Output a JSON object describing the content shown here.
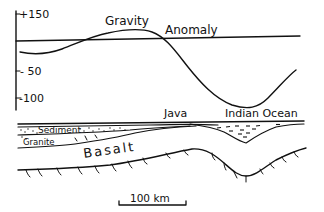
{
  "figure": {
    "type": "geological cross-section with gravity anomaly profile",
    "gravity_panel": {
      "axis_ticks": [
        {
          "label": "+150",
          "value": 150
        },
        {
          "label": "- 50",
          "value": -50
        },
        {
          "label": "-100",
          "value": -100
        }
      ],
      "title_part1": "Gravity",
      "title_part2": "Anomaly"
    },
    "section": {
      "place_labels": {
        "java": "Java",
        "indian_ocean": "Indian Ocean"
      },
      "layer_labels": {
        "sediment": "Sediment",
        "granite": "Granite",
        "basalt": "Basalt"
      }
    },
    "scale_bar": {
      "label": "100 km"
    },
    "colors": {
      "ink": "#111111",
      "background": "#ffffff"
    }
  }
}
